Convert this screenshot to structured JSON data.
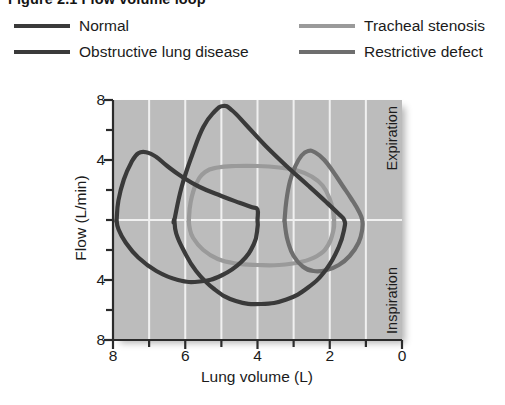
{
  "figure": {
    "title": "Figure 2.1 Flow volume loop"
  },
  "legend": {
    "items": [
      {
        "label": "Normal",
        "color": "#3a3a3a"
      },
      {
        "label": "Obstructive lung disease",
        "color": "#3a3a3a"
      },
      {
        "label": "Tracheal stenosis",
        "color": "#9a9a9a"
      },
      {
        "label": "Restrictive defect",
        "color": "#6e6e6e"
      }
    ]
  },
  "plot": {
    "panel_color": "#bcbcbc",
    "grid_color": "#f0f0f0",
    "phase_labels": {
      "upper": "Expiration",
      "lower": "Inspiration"
    }
  },
  "chart_data": {
    "type": "line",
    "title": "Figure 2.1 Flow volume loop",
    "xlabel": "Lung volume (L)",
    "ylabel": "Flow (L/min)",
    "xlim": [
      8,
      0
    ],
    "ylim": [
      -8,
      8
    ],
    "x_ticks": [
      8,
      6,
      4,
      2,
      0
    ],
    "x_minor_ticks": [
      7,
      5,
      3,
      1
    ],
    "y_ticks": [
      8,
      4,
      0,
      -4,
      -8
    ],
    "y_tick_labels": [
      "8",
      "4",
      "",
      "4",
      "8"
    ],
    "y_minor_ticks": [
      6,
      2,
      -2,
      -6
    ],
    "grid": true,
    "grid_axis": "x",
    "legend_position": "above-plot",
    "annotations": [
      {
        "text": "Expiration",
        "region": "flow > 0"
      },
      {
        "text": "Inspiration",
        "region": "flow < 0"
      }
    ],
    "note": "Closed flow-volume loops; x-axis reversed (high lung volume at left). Positive flow = expiration, negative flow = inspiration.",
    "series": [
      {
        "name": "Normal",
        "color": "#3a3a3a",
        "points": [
          [
            6.3,
            0.0
          ],
          [
            6.1,
            2.2
          ],
          [
            5.8,
            4.4
          ],
          [
            5.5,
            6.2
          ],
          [
            5.2,
            7.2
          ],
          [
            4.95,
            7.6
          ],
          [
            4.7,
            7.3
          ],
          [
            4.3,
            6.3
          ],
          [
            3.8,
            5.0
          ],
          [
            3.2,
            3.6
          ],
          [
            2.6,
            2.3
          ],
          [
            2.1,
            1.2
          ],
          [
            1.75,
            0.4
          ],
          [
            1.6,
            0.0
          ],
          [
            1.6,
            -0.6
          ],
          [
            1.75,
            -1.8
          ],
          [
            2.1,
            -3.3
          ],
          [
            2.6,
            -4.5
          ],
          [
            3.2,
            -5.3
          ],
          [
            3.9,
            -5.6
          ],
          [
            4.6,
            -5.4
          ],
          [
            5.2,
            -4.6
          ],
          [
            5.7,
            -3.4
          ],
          [
            6.05,
            -2.0
          ],
          [
            6.25,
            -0.9
          ],
          [
            6.3,
            0.0
          ]
        ]
      },
      {
        "name": "Obstructive lung disease",
        "color": "#3a3a3a",
        "points": [
          [
            7.9,
            0.0
          ],
          [
            7.85,
            1.3
          ],
          [
            7.7,
            2.7
          ],
          [
            7.5,
            3.8
          ],
          [
            7.3,
            4.45
          ],
          [
            7.05,
            4.5
          ],
          [
            6.8,
            4.2
          ],
          [
            6.5,
            3.6
          ],
          [
            6.1,
            2.9
          ],
          [
            5.6,
            2.2
          ],
          [
            5.0,
            1.6
          ],
          [
            4.5,
            1.15
          ],
          [
            4.15,
            0.85
          ],
          [
            4.0,
            0.7
          ],
          [
            4.0,
            0.0
          ],
          [
            4.0,
            -0.5
          ],
          [
            4.1,
            -1.6
          ],
          [
            4.45,
            -2.8
          ],
          [
            5.0,
            -3.7
          ],
          [
            5.6,
            -4.1
          ],
          [
            6.2,
            -4.0
          ],
          [
            6.8,
            -3.4
          ],
          [
            7.3,
            -2.5
          ],
          [
            7.65,
            -1.5
          ],
          [
            7.85,
            -0.6
          ],
          [
            7.9,
            0.0
          ]
        ]
      },
      {
        "name": "Tracheal stenosis",
        "color": "#9a9a9a",
        "points": [
          [
            5.9,
            0.0
          ],
          [
            5.85,
            1.2
          ],
          [
            5.7,
            2.4
          ],
          [
            5.45,
            3.2
          ],
          [
            5.1,
            3.5
          ],
          [
            4.6,
            3.6
          ],
          [
            4.0,
            3.6
          ],
          [
            3.4,
            3.5
          ],
          [
            2.9,
            3.3
          ],
          [
            2.5,
            2.9
          ],
          [
            2.2,
            2.3
          ],
          [
            2.0,
            1.4
          ],
          [
            1.9,
            0.5
          ],
          [
            1.88,
            0.0
          ],
          [
            1.9,
            -0.7
          ],
          [
            2.05,
            -1.7
          ],
          [
            2.35,
            -2.4
          ],
          [
            2.8,
            -2.8
          ],
          [
            3.4,
            -3.0
          ],
          [
            4.0,
            -3.0
          ],
          [
            4.6,
            -2.9
          ],
          [
            5.1,
            -2.6
          ],
          [
            5.5,
            -2.0
          ],
          [
            5.78,
            -1.2
          ],
          [
            5.88,
            -0.5
          ],
          [
            5.9,
            0.0
          ]
        ]
      },
      {
        "name": "Restrictive defect",
        "color": "#6e6e6e",
        "points": [
          [
            3.25,
            0.0
          ],
          [
            3.2,
            1.3
          ],
          [
            3.1,
            2.6
          ],
          [
            2.95,
            3.6
          ],
          [
            2.78,
            4.3
          ],
          [
            2.6,
            4.6
          ],
          [
            2.4,
            4.5
          ],
          [
            2.15,
            4.0
          ],
          [
            1.9,
            3.2
          ],
          [
            1.65,
            2.3
          ],
          [
            1.4,
            1.4
          ],
          [
            1.2,
            0.6
          ],
          [
            1.1,
            0.0
          ],
          [
            1.1,
            -0.6
          ],
          [
            1.2,
            -1.5
          ],
          [
            1.45,
            -2.4
          ],
          [
            1.75,
            -3.0
          ],
          [
            2.1,
            -3.35
          ],
          [
            2.45,
            -3.4
          ],
          [
            2.75,
            -3.1
          ],
          [
            3.0,
            -2.4
          ],
          [
            3.15,
            -1.5
          ],
          [
            3.22,
            -0.7
          ],
          [
            3.25,
            0.0
          ]
        ]
      }
    ]
  }
}
